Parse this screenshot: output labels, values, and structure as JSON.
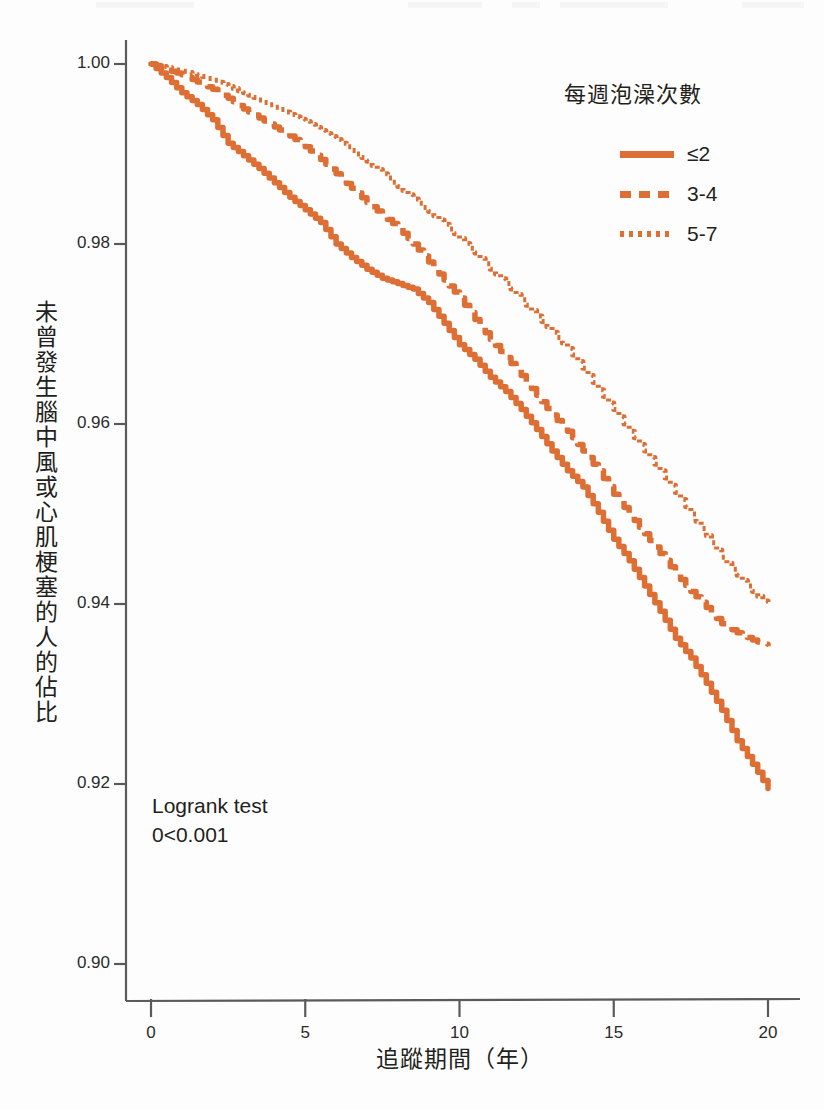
{
  "chart_data": {
    "type": "line",
    "title": "",
    "xlabel": "追蹤期間（年）",
    "ylabel": "未曾發生腦中風或心肌梗塞的人的佔比",
    "xlim": [
      0,
      20.2
    ],
    "ylim": [
      0.895,
      1.003
    ],
    "grid": false,
    "legend_position": "top-right",
    "legend_title": "每週泡澡次數",
    "xticks": [
      "0",
      "5",
      "10",
      "15",
      "20"
    ],
    "xtick_values": [
      0,
      5,
      10,
      15,
      20
    ],
    "yticks": [
      "0.90",
      "0.92",
      "0.94",
      "0.96",
      "0.98",
      "1.00"
    ],
    "ytick_values": [
      0.9,
      0.92,
      0.94,
      0.96,
      0.98,
      1.0
    ],
    "annotations": [
      "Logrank test",
      "0<0.001"
    ],
    "series": [
      {
        "name": "≤2",
        "style": "solid",
        "color": "#dd6e34",
        "x": [
          0,
          0.5,
          1,
          1.5,
          2,
          2.5,
          3,
          3.5,
          4,
          4.5,
          5,
          5.5,
          6,
          6.5,
          7,
          7.5,
          8,
          8.5,
          9,
          9.5,
          10,
          10.5,
          11,
          11.5,
          12,
          12.5,
          13,
          13.5,
          14,
          14.5,
          15,
          15.5,
          16,
          16.5,
          17,
          17.5,
          18,
          18.5,
          19,
          19.5,
          20
        ],
        "values": [
          1.0,
          0.9985,
          0.9968,
          0.9955,
          0.9938,
          0.9912,
          0.9898,
          0.9884,
          0.9868,
          0.9852,
          0.9838,
          0.9824,
          0.98,
          0.9785,
          0.9772,
          0.9762,
          0.9756,
          0.975,
          0.9735,
          0.9712,
          0.9688,
          0.9672,
          0.9652,
          0.9636,
          0.9616,
          0.9594,
          0.957,
          0.9548,
          0.953,
          0.9502,
          0.9472,
          0.9448,
          0.942,
          0.9392,
          0.9362,
          0.934,
          0.9312,
          0.9282,
          0.9248,
          0.9222,
          0.9195
        ]
      },
      {
        "name": "3-4",
        "style": "dashed",
        "color": "#dd6e34",
        "x": [
          0,
          0.5,
          1,
          1.5,
          2,
          2.5,
          3,
          3.5,
          4,
          4.5,
          5,
          5.5,
          6,
          6.5,
          7,
          7.5,
          8,
          8.5,
          9,
          9.5,
          10,
          10.5,
          11,
          11.5,
          12,
          12.5,
          13,
          13.5,
          14,
          14.5,
          15,
          15.5,
          16,
          16.5,
          17,
          17.5,
          18,
          18.5,
          19,
          19.5,
          20
        ],
        "values": [
          1.0,
          0.9994,
          0.9988,
          0.998,
          0.9972,
          0.9962,
          0.995,
          0.994,
          0.993,
          0.992,
          0.9908,
          0.9894,
          0.9878,
          0.9862,
          0.9846,
          0.9832,
          0.9818,
          0.98,
          0.978,
          0.976,
          0.974,
          0.9716,
          0.9694,
          0.9674,
          0.9654,
          0.9632,
          0.961,
          0.9592,
          0.957,
          0.9548,
          0.9522,
          0.95,
          0.9478,
          0.9456,
          0.9434,
          0.9414,
          0.9396,
          0.9378,
          0.9368,
          0.936,
          0.9353
        ]
      },
      {
        "name": "5-7",
        "style": "dotted",
        "color": "#dd6e34",
        "x": [
          0,
          0.5,
          1,
          1.5,
          2,
          2.5,
          3,
          3.5,
          4,
          4.5,
          5,
          5.5,
          6,
          6.5,
          7,
          7.5,
          8,
          8.5,
          9,
          9.5,
          10,
          10.5,
          11,
          11.5,
          12,
          12.5,
          13,
          13.5,
          14,
          14.5,
          15,
          15.5,
          16,
          16.5,
          17,
          17.5,
          18,
          18.5,
          19,
          19.5,
          20
        ],
        "values": [
          1.0,
          0.9996,
          0.9992,
          0.9988,
          0.9982,
          0.9975,
          0.9968,
          0.996,
          0.9952,
          0.9944,
          0.9936,
          0.9926,
          0.9916,
          0.9904,
          0.9892,
          0.9878,
          0.9864,
          0.985,
          0.9836,
          0.9822,
          0.9806,
          0.979,
          0.9772,
          0.9756,
          0.9738,
          0.972,
          0.9702,
          0.9684,
          0.9662,
          0.9638,
          0.9616,
          0.9592,
          0.957,
          0.9548,
          0.9524,
          0.95,
          0.9476,
          0.9452,
          0.9432,
          0.9414,
          0.9398
        ]
      }
    ]
  },
  "axes": {
    "y_title": "未曾發生腦中風或心肌梗塞的人的佔比",
    "x_title": "追蹤期間（年）",
    "y_ticks": [
      "1.00",
      "0.98",
      "0.96",
      "0.94",
      "0.92",
      "0.90"
    ],
    "x_ticks": [
      "0",
      "5",
      "10",
      "15",
      "20"
    ]
  },
  "legend": {
    "title": "每週泡澡次數",
    "items": [
      {
        "label": "≤2",
        "style": "solid"
      },
      {
        "label": "3-4",
        "style": "dashed"
      },
      {
        "label": "5-7",
        "style": "dotted"
      }
    ]
  },
  "annotation": {
    "line1": "Logrank test",
    "line2": "0<0.001"
  },
  "colors": {
    "series": "#dd6e34",
    "axis": "#5a5a5a",
    "text": "#231f20"
  }
}
